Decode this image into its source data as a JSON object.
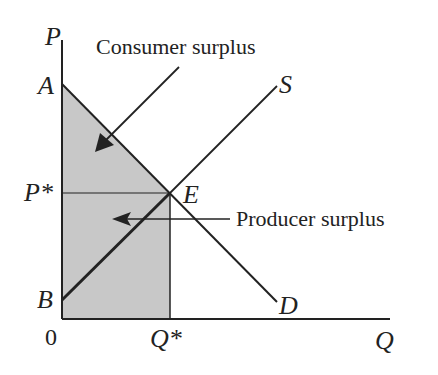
{
  "diagram": {
    "axes": {
      "y_label": "P",
      "x_label": "Q",
      "origin": "0"
    },
    "points": {
      "A": "A",
      "B": "B",
      "E": "E",
      "P_star": "P*",
      "Q_star": "Q*"
    },
    "curves": {
      "supply": "S",
      "demand": "D"
    },
    "annotations": {
      "consumer_surplus": "Consumer surplus",
      "producer_surplus": "Producer surplus"
    },
    "colors": {
      "shade": "#c8c8c8",
      "line": "#222222"
    }
  }
}
